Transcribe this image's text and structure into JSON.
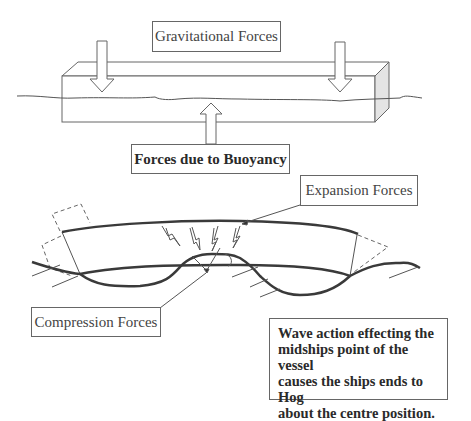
{
  "top_diagram": {
    "title": "Ship beam floating in water",
    "labels": {
      "gravitational": "Gravitational  Forces",
      "buoyancy": "Forces due to Buoyancy"
    }
  },
  "bottom_diagram": {
    "title": "Hogging in waves",
    "labels": {
      "expansion": "Expansion Forces",
      "compression": "Compression Forces",
      "explanation": "Wave action effecting the\nmidships point of the vessel\ncauses the ships ends to Hog\nabout the centre position."
    }
  },
  "colors": {
    "line": "#555555",
    "hull": "#3a3a3a",
    "end_face_fill": "#e4e4e4"
  }
}
